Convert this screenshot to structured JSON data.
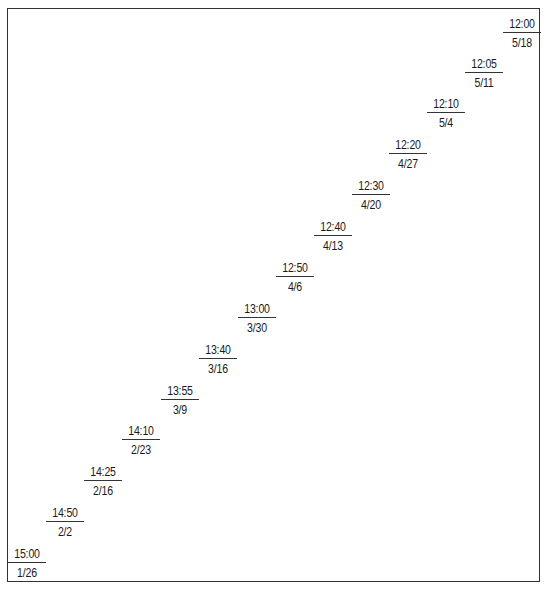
{
  "entries": [
    {
      "time": "12:00",
      "date": "5/18",
      "x": 503,
      "y": 17
    },
    {
      "time": "12:05",
      "date": "5/11",
      "x": 465,
      "y": 57
    },
    {
      "time": "12:10",
      "date": "5/4",
      "x": 427,
      "y": 97
    },
    {
      "time": "12:20",
      "date": "4/27",
      "x": 389,
      "y": 138
    },
    {
      "time": "12:30",
      "date": "4/20",
      "x": 352,
      "y": 179
    },
    {
      "time": "12:40",
      "date": "4/13",
      "x": 314,
      "y": 220
    },
    {
      "time": "12:50",
      "date": "4/6",
      "x": 276,
      "y": 261
    },
    {
      "time": "13:00",
      "date": "3/30",
      "x": 238,
      "y": 302
    },
    {
      "time": "13:40",
      "date": "3/16",
      "x": 199,
      "y": 343
    },
    {
      "time": "13:55",
      "date": "3/9",
      "x": 161,
      "y": 384
    },
    {
      "time": "14:10",
      "date": "2/23",
      "x": 122,
      "y": 424
    },
    {
      "time": "14:25",
      "date": "2/16",
      "x": 84,
      "y": 465
    },
    {
      "time": "14:50",
      "date": "2/2",
      "x": 46,
      "y": 506
    },
    {
      "time": "15:00",
      "date": "1/26",
      "x": 8,
      "y": 547
    }
  ]
}
